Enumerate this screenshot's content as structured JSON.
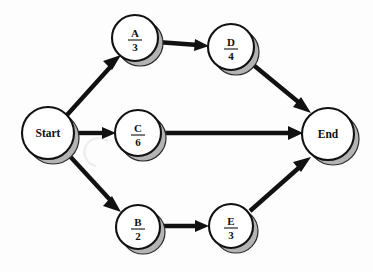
{
  "diagram": {
    "type": "activity-network-diagram",
    "title": "",
    "background_color": "#fdfdfd",
    "node_fill": "#ffffff",
    "node_stroke": "#111111",
    "shadow_color": "#b3b3b3",
    "edge_color": "#111111",
    "nodes": [
      {
        "id": "start",
        "name": "start-node",
        "label": "Start",
        "kind": "terminal",
        "cx": 48,
        "cy": 133,
        "r": 26
      },
      {
        "id": "a",
        "name": "activity-node-a",
        "letter": "A",
        "duration": "3",
        "kind": "activity",
        "cx": 135,
        "cy": 38,
        "r": 23
      },
      {
        "id": "d",
        "name": "activity-node-d",
        "letter": "D",
        "duration": "4",
        "kind": "activity",
        "cx": 231,
        "cy": 47,
        "r": 23
      },
      {
        "id": "c",
        "name": "activity-node-c",
        "letter": "C",
        "duration": "6",
        "kind": "activity",
        "cx": 138,
        "cy": 133,
        "r": 23
      },
      {
        "id": "b",
        "name": "activity-node-b",
        "letter": "B",
        "duration": "2",
        "kind": "activity",
        "cx": 138,
        "cy": 227,
        "r": 22
      },
      {
        "id": "e",
        "name": "activity-node-e",
        "letter": "E",
        "duration": "3",
        "kind": "activity",
        "cx": 231,
        "cy": 226,
        "r": 22
      },
      {
        "id": "end",
        "name": "end-node",
        "label": "End",
        "kind": "terminal",
        "cx": 328,
        "cy": 134,
        "r": 26
      }
    ],
    "edges": [
      {
        "name": "edge-start-to-a",
        "from": "start",
        "to": "a"
      },
      {
        "name": "edge-start-to-c",
        "from": "start",
        "to": "c"
      },
      {
        "name": "edge-start-to-b",
        "from": "start",
        "to": "b"
      },
      {
        "name": "edge-a-to-d",
        "from": "a",
        "to": "d"
      },
      {
        "name": "edge-d-to-end",
        "from": "d",
        "to": "end"
      },
      {
        "name": "edge-c-to-end",
        "from": "c",
        "to": "end"
      },
      {
        "name": "edge-b-to-e",
        "from": "b",
        "to": "e"
      },
      {
        "name": "edge-e-to-end",
        "from": "e",
        "to": "end"
      }
    ]
  }
}
